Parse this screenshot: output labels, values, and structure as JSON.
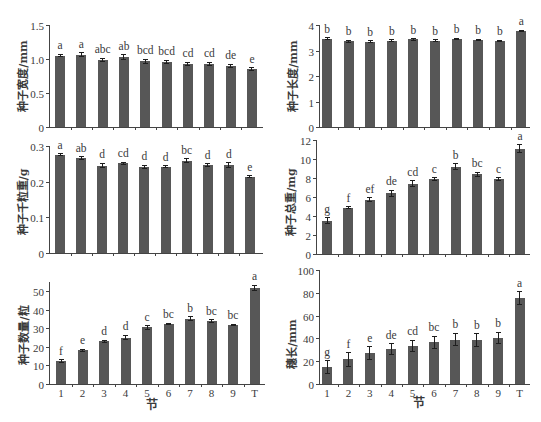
{
  "style": {
    "bar_color": "#575757",
    "error_bar_color": "#1e1e1e",
    "text_color": "#3a3a3a",
    "background": "#ffffff"
  },
  "chart_data": [
    {
      "type": "bar",
      "title": "",
      "xlabel": "",
      "ylabel": "种子宽度/mm",
      "categories": [
        "1",
        "2",
        "3",
        "4",
        "5",
        "6",
        "7",
        "8",
        "9",
        "T"
      ],
      "show_xtick_labels": false,
      "values": [
        1.05,
        1.06,
        0.99,
        1.03,
        0.97,
        0.96,
        0.93,
        0.93,
        0.9,
        0.85
      ],
      "errors": [
        0.02,
        0.03,
        0.02,
        0.03,
        0.03,
        0.02,
        0.02,
        0.02,
        0.02,
        0.02
      ],
      "letters": [
        "a",
        "a",
        "abc",
        "ab",
        "bcd",
        "bcd",
        "cd",
        "cd",
        "de",
        "e"
      ],
      "ylim": [
        0,
        1.5
      ],
      "yticks": [
        0,
        0.5,
        1.0,
        1.5
      ],
      "ytick_labels": [
        "0",
        "0.5",
        "1.0",
        "1.5"
      ],
      "grid": false
    },
    {
      "type": "bar",
      "title": "",
      "xlabel": "",
      "ylabel": "种子长度/mm",
      "categories": [
        "1",
        "2",
        "3",
        "4",
        "5",
        "6",
        "7",
        "8",
        "9",
        "T"
      ],
      "show_xtick_labels": false,
      "values": [
        3.46,
        3.36,
        3.34,
        3.38,
        3.44,
        3.38,
        3.46,
        3.41,
        3.38,
        3.77
      ],
      "errors": [
        0.04,
        0.04,
        0.04,
        0.04,
        0.03,
        0.04,
        0.03,
        0.03,
        0.03,
        0.03
      ],
      "letters": [
        "b",
        "b",
        "b",
        "b",
        "b",
        "b",
        "b",
        "b",
        "b",
        "a"
      ],
      "ylim": [
        0,
        4
      ],
      "yticks": [
        0,
        1,
        2,
        3,
        4
      ],
      "ytick_labels": [
        "0",
        "1",
        "2",
        "3",
        "4"
      ],
      "grid": false
    },
    {
      "type": "bar",
      "title": "",
      "xlabel": "",
      "ylabel": "种子千粒重/g",
      "categories": [
        "1",
        "2",
        "3",
        "4",
        "5",
        "6",
        "7",
        "8",
        "9",
        "T"
      ],
      "show_xtick_labels": false,
      "values": [
        0.276,
        0.266,
        0.245,
        0.251,
        0.242,
        0.242,
        0.259,
        0.246,
        0.247,
        0.214
      ],
      "errors": [
        0.002,
        0.004,
        0.006,
        0.003,
        0.004,
        0.003,
        0.005,
        0.004,
        0.006,
        0.002
      ],
      "letters": [
        "a",
        "ab",
        "d",
        "cd",
        "d",
        "d",
        "bc",
        "d",
        "d",
        "e"
      ],
      "ylim": [
        0,
        0.3
      ],
      "yticks": [
        0,
        0.1,
        0.2,
        0.3
      ],
      "ytick_labels": [
        "0",
        "0.1",
        "0.2",
        "0.3"
      ],
      "grid": false
    },
    {
      "type": "bar",
      "title": "",
      "xlabel": "",
      "ylabel": "种子总重/mg",
      "categories": [
        "1",
        "2",
        "3",
        "4",
        "5",
        "6",
        "7",
        "8",
        "9",
        "T"
      ],
      "show_xtick_labels": false,
      "values": [
        3.5,
        4.85,
        5.7,
        6.4,
        7.4,
        7.9,
        9.2,
        8.4,
        7.9,
        11.1
      ],
      "errors": [
        0.3,
        0.1,
        0.2,
        0.3,
        0.3,
        0.15,
        0.3,
        0.2,
        0.15,
        0.4
      ],
      "letters": [
        "g",
        "f",
        "ef",
        "de",
        "cd",
        "c",
        "b",
        "bc",
        "c",
        "a"
      ],
      "ylim": [
        0,
        12
      ],
      "yticks": [
        0,
        2,
        4,
        6,
        8,
        10,
        12
      ],
      "ytick_labels": [
        "0",
        "2",
        "4",
        "6",
        "8",
        "10",
        "12"
      ],
      "grid": false
    },
    {
      "type": "bar",
      "title": "",
      "xlabel": "节",
      "ylabel": "种子数量/粒",
      "categories": [
        "1",
        "2",
        "3",
        "4",
        "5",
        "6",
        "7",
        "8",
        "9",
        "T"
      ],
      "show_xtick_labels": true,
      "values": [
        12.4,
        18.2,
        23.0,
        25.0,
        30.5,
        32.4,
        35.3,
        34.0,
        31.8,
        51.8
      ],
      "errors": [
        0.8,
        0.5,
        0.7,
        1.2,
        1.0,
        0.4,
        0.9,
        0.6,
        0.5,
        1.5
      ],
      "letters": [
        "f",
        "e",
        "d",
        "d",
        "c",
        "bc",
        "b",
        "bc",
        "bc",
        "a"
      ],
      "ylim": [
        0,
        55
      ],
      "yticks": [
        0,
        10,
        20,
        30,
        40,
        50
      ],
      "ytick_labels": [
        "0",
        "10",
        "20",
        "30",
        "40",
        "50"
      ],
      "grid": false
    },
    {
      "type": "bar",
      "title": "",
      "xlabel": "节",
      "ylabel": "穗长/mm",
      "categories": [
        "1",
        "2",
        "3",
        "4",
        "5",
        "6",
        "7",
        "8",
        "9",
        "T"
      ],
      "show_xtick_labels": true,
      "values": [
        15.0,
        21.5,
        27.0,
        30.5,
        33.3,
        36.5,
        39.0,
        38.5,
        40.5,
        75.5
      ],
      "errors": [
        5.5,
        6.0,
        5.5,
        5.0,
        5.0,
        5.5,
        5.5,
        5.5,
        5.0,
        5.5
      ],
      "letters": [
        "g",
        "f",
        "e",
        "de",
        "cd",
        "bc",
        "b",
        "b",
        "b",
        "a"
      ],
      "ylim": [
        0,
        100
      ],
      "yticks": [
        0,
        20,
        40,
        60,
        80,
        100
      ],
      "ytick_labels": [
        "0",
        "20",
        "40",
        "60",
        "80",
        "100"
      ],
      "grid": false
    }
  ]
}
